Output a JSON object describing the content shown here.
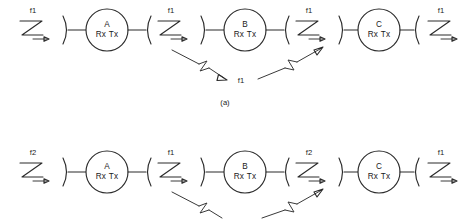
{
  "figure": {
    "caption_a": "(a)",
    "rx_tx_label": "Rx Tx"
  },
  "diagram_a": {
    "name": "single-frequency-relay-chain",
    "nodes": [
      {
        "label": "A",
        "radio": "Rx Tx"
      },
      {
        "label": "B",
        "radio": "Rx Tx"
      },
      {
        "label": "C",
        "radio": "Rx Tx"
      }
    ],
    "frequencies": {
      "input": "f1",
      "a_to_b": "f1",
      "b_to_c": "f1",
      "output": "f1",
      "interference": "f1"
    }
  },
  "diagram_b": {
    "name": "alternating-frequency-relay-chain",
    "nodes": [
      {
        "label": "A",
        "radio": "Rx Tx"
      },
      {
        "label": "B",
        "radio": "Rx Tx"
      },
      {
        "label": "C",
        "radio": "Rx Tx"
      }
    ],
    "frequencies": {
      "input": "f2",
      "a_to_b": "f1",
      "b_to_c": "f2",
      "output": "f1"
    }
  },
  "colors": {
    "stroke": "#2b2b2b",
    "text": "#1a1a1a",
    "background": "#ffffff"
  }
}
